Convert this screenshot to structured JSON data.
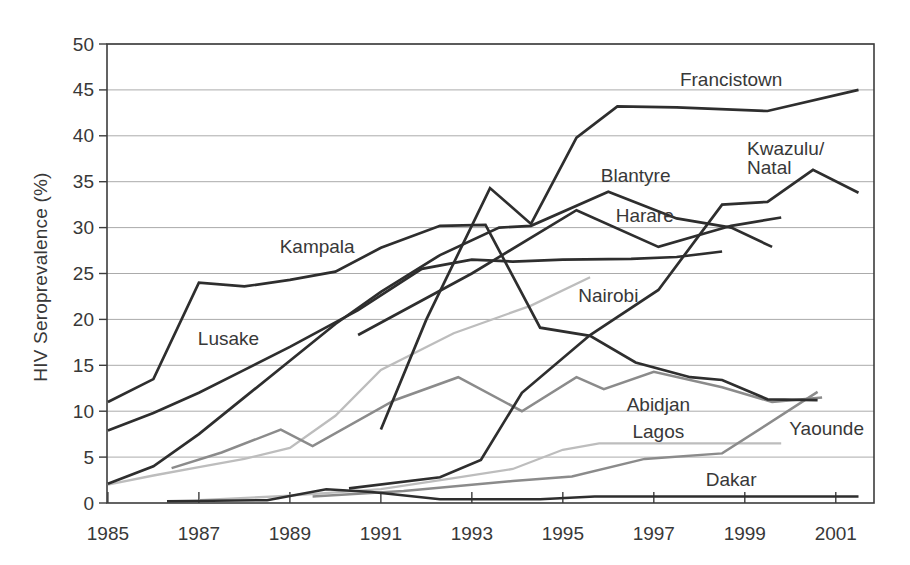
{
  "chart_data": {
    "type": "line",
    "title": "",
    "xlabel": "",
    "ylabel": "HIV Seroprevalence (%)",
    "xlim": [
      1984.98,
      2001.84
    ],
    "ylim": [
      0,
      50
    ],
    "x_ticks": [
      1985,
      1987,
      1989,
      1991,
      1993,
      1995,
      1997,
      1999,
      2001
    ],
    "y_ticks": [
      0,
      5,
      10,
      15,
      20,
      25,
      30,
      35,
      40,
      45,
      50
    ],
    "grid": "horizontal",
    "legend": "inline-labels",
    "palette": {
      "dark": "#2e2e2e",
      "medium": "#8b8b8b",
      "light": "#bdbdbd"
    },
    "text_color": "#383838",
    "grid_color": "#ababab",
    "frame_color": "#3d3d3d",
    "series": [
      {
        "id": "nairobi",
        "name": "Nairobi",
        "color": "light",
        "width": 2.3,
        "points": [
          [
            1985,
            2
          ],
          [
            1986,
            3
          ],
          [
            1987,
            3.9
          ],
          [
            1988,
            4.8
          ],
          [
            1989,
            6
          ],
          [
            1990,
            9.5
          ],
          [
            1991,
            14.5
          ],
          [
            1992.6,
            18.5
          ],
          [
            1994.3,
            21.5
          ],
          [
            1995.6,
            24.6
          ]
        ],
        "label": {
          "text": "Nairobi",
          "x": 1996.0,
          "y": 22.6,
          "anchor": "middle"
        }
      },
      {
        "id": "lagos",
        "name": "Lagos",
        "color": "light",
        "width": 2.3,
        "points": [
          [
            1987,
            0.3
          ],
          [
            1989,
            0.8
          ],
          [
            1991,
            1.5
          ],
          [
            1992.6,
            2.7
          ],
          [
            1993.9,
            3.7
          ],
          [
            1995,
            5.8
          ],
          [
            1995.8,
            6.5
          ],
          [
            1999.8,
            6.5
          ]
        ],
        "label": {
          "text": "Lagos",
          "x": 1997.1,
          "y": 7.8,
          "anchor": "middle"
        }
      },
      {
        "id": "abidjan",
        "name": "Abidjan",
        "color": "medium",
        "width": 2.5,
        "points": [
          [
            1986.4,
            3.8
          ],
          [
            1987.5,
            5.5
          ],
          [
            1988.8,
            8
          ],
          [
            1989.5,
            6.2
          ],
          [
            1991.3,
            11.2
          ],
          [
            1992.7,
            13.7
          ],
          [
            1994.1,
            10
          ],
          [
            1995.3,
            13.7
          ],
          [
            1995.9,
            12.4
          ],
          [
            1997,
            14.3
          ],
          [
            1998.5,
            12.6
          ],
          [
            1999.6,
            11
          ],
          [
            2000.7,
            11.5
          ]
        ],
        "label": {
          "text": "Abidjan",
          "x": 1997.1,
          "y": 10.7,
          "anchor": "middle"
        }
      },
      {
        "id": "yaounde",
        "name": "Yaounde",
        "color": "medium",
        "width": 2.5,
        "points": [
          [
            1989.5,
            0.7
          ],
          [
            1991.5,
            1.3
          ],
          [
            1993.9,
            2.4
          ],
          [
            1995.2,
            2.9
          ],
          [
            1996.8,
            4.8
          ],
          [
            1998.5,
            5.4
          ],
          [
            2000.6,
            12.1
          ]
        ],
        "label": {
          "text": "Yaounde",
          "x": 2000.8,
          "y": 8.1,
          "anchor": "middle"
        }
      },
      {
        "id": "dakar",
        "name": "Dakar",
        "color": "dark",
        "width": 2.5,
        "points": [
          [
            1986.3,
            0.2
          ],
          [
            1988.5,
            0.3
          ],
          [
            1989.8,
            1.5
          ],
          [
            1990.8,
            1.2
          ],
          [
            1992.3,
            0.4
          ],
          [
            1994.5,
            0.4
          ],
          [
            1995.7,
            0.7
          ],
          [
            1998,
            0.7
          ],
          [
            2001.5,
            0.7
          ]
        ],
        "label": {
          "text": "Dakar",
          "x": 1998.7,
          "y": 2.6,
          "anchor": "middle"
        }
      },
      {
        "id": "lusake",
        "name": "Lusake",
        "color": "dark",
        "width": 2.7,
        "points": [
          [
            1985,
            7.9
          ],
          [
            1986,
            9.8
          ],
          [
            1987,
            12
          ],
          [
            1988,
            14.5
          ],
          [
            1989,
            17
          ],
          [
            1990.5,
            21
          ],
          [
            1991.9,
            25.5
          ],
          [
            1993,
            26.5
          ],
          [
            1993.9,
            26.3
          ],
          [
            1995,
            26.5
          ],
          [
            1996.5,
            26.6
          ],
          [
            1997.5,
            26.8
          ],
          [
            1998.5,
            27.4
          ]
        ],
        "label": {
          "text": "Lusake",
          "x": 1987.65,
          "y": 17.9,
          "anchor": "middle"
        }
      },
      {
        "id": "blantyre",
        "name": "Blantyre",
        "color": "dark",
        "width": 2.7,
        "points": [
          [
            1985,
            2.1
          ],
          [
            1986,
            4
          ],
          [
            1987,
            7.5
          ],
          [
            1988,
            11.5
          ],
          [
            1989,
            15.5
          ],
          [
            1990,
            19.5
          ],
          [
            1991,
            23
          ],
          [
            1992.3,
            27
          ],
          [
            1993.6,
            30
          ],
          [
            1994.3,
            30.2
          ],
          [
            1996,
            33.9
          ],
          [
            1997.5,
            31
          ],
          [
            1998.7,
            30
          ],
          [
            1999.6,
            27.9
          ]
        ],
        "label": {
          "text": "Blantyre",
          "x": 1996.6,
          "y": 35.7,
          "anchor": "middle"
        }
      },
      {
        "id": "harare",
        "name": "Harare",
        "color": "dark",
        "width": 2.7,
        "points": [
          [
            1990.5,
            18.3
          ],
          [
            1993,
            25
          ],
          [
            1995.3,
            31.9
          ],
          [
            1997.1,
            27.9
          ],
          [
            1998.7,
            30.2
          ],
          [
            1999.8,
            31.1
          ]
        ],
        "label": {
          "text": "Harare",
          "x": 1996.8,
          "y": 31.3,
          "anchor": "middle"
        }
      },
      {
        "id": "kampala",
        "name": "Kampala",
        "color": "dark",
        "width": 2.7,
        "points": [
          [
            1985,
            11
          ],
          [
            1986,
            13.5
          ],
          [
            1987,
            24
          ],
          [
            1988,
            23.6
          ],
          [
            1989,
            24.3
          ],
          [
            1990,
            25.2
          ],
          [
            1991,
            27.8
          ],
          [
            1992.3,
            30.2
          ],
          [
            1993.3,
            30.3
          ],
          [
            1994.5,
            19.1
          ],
          [
            1995.6,
            18.2
          ],
          [
            1996.6,
            15.3
          ],
          [
            1997.8,
            13.7
          ],
          [
            1998.5,
            13.4
          ],
          [
            1999.5,
            11.3
          ],
          [
            2000.6,
            11.2
          ]
        ],
        "label": {
          "text": "Kampala",
          "x": 1989.6,
          "y": 27.9,
          "anchor": "middle"
        }
      },
      {
        "id": "kwazulu-natal",
        "name": "Kwazulu/Natal",
        "color": "dark",
        "width": 2.7,
        "points": [
          [
            1990.3,
            1.6
          ],
          [
            1992.3,
            2.8
          ],
          [
            1993.2,
            4.7
          ],
          [
            1994.1,
            12
          ],
          [
            1995.6,
            18.3
          ],
          [
            1997.1,
            23.2
          ],
          [
            1998.5,
            32.5
          ],
          [
            1999.5,
            32.8
          ],
          [
            2000.5,
            36.3
          ],
          [
            2001.5,
            33.8
          ]
        ],
        "label": {
          "lines": [
            "Kwazulu/",
            "Natal"
          ],
          "x": 1999.05,
          "y": 38.6,
          "anchor": "start",
          "line_height": 2.0
        }
      },
      {
        "id": "francistown",
        "name": "Francistown",
        "color": "dark",
        "width": 2.7,
        "points": [
          [
            1991,
            8
          ],
          [
            1992,
            20
          ],
          [
            1993.4,
            34.3
          ],
          [
            1994.3,
            30.4
          ],
          [
            1995.3,
            39.8
          ],
          [
            1996.2,
            43.2
          ],
          [
            1997.5,
            43.1
          ],
          [
            1999.5,
            42.7
          ],
          [
            2001.5,
            45
          ]
        ],
        "label": {
          "text": "Francistown",
          "x": 1998.7,
          "y": 46.1,
          "anchor": "middle"
        }
      }
    ]
  }
}
